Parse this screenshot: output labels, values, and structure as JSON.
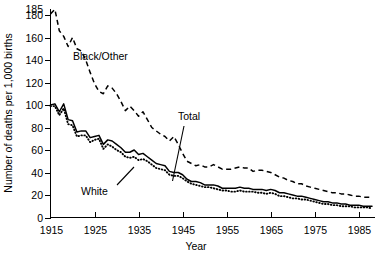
{
  "chart_data": {
    "type": "line",
    "title": "",
    "xlabel": "Year",
    "ylabel": "Number of deaths per 1,000 births",
    "xlim": [
      1915,
      1988
    ],
    "ylim": [
      0,
      185
    ],
    "grid": false,
    "legend_position": "inline-annotations",
    "xticks": [
      1915,
      1925,
      1935,
      1945,
      1955,
      1965,
      1975,
      1985
    ],
    "xtick_labels": [
      "1915",
      "1925",
      "1935",
      "1945",
      "1955",
      "1965",
      "1975",
      "1985"
    ],
    "yticks": [
      0,
      20,
      40,
      60,
      80,
      100,
      120,
      140,
      160,
      180,
      185
    ],
    "ytick_labels": [
      "0",
      "20",
      "40",
      "60",
      "80",
      "100",
      "120",
      "140",
      "160",
      "180",
      "185"
    ],
    "annotations": [
      {
        "text": "Black/Other",
        "series": "Black/Other"
      },
      {
        "text": "Total",
        "series": "Total"
      },
      {
        "text": "White",
        "series": "White"
      }
    ],
    "x": [
      1915,
      1916,
      1917,
      1918,
      1919,
      1920,
      1921,
      1922,
      1923,
      1924,
      1925,
      1926,
      1927,
      1928,
      1929,
      1930,
      1931,
      1932,
      1933,
      1934,
      1935,
      1936,
      1937,
      1938,
      1939,
      1940,
      1941,
      1942,
      1943,
      1944,
      1945,
      1946,
      1947,
      1948,
      1949,
      1950,
      1951,
      1952,
      1953,
      1954,
      1955,
      1956,
      1957,
      1958,
      1959,
      1960,
      1961,
      1962,
      1963,
      1964,
      1965,
      1966,
      1967,
      1968,
      1969,
      1970,
      1971,
      1972,
      1973,
      1974,
      1975,
      1976,
      1977,
      1978,
      1979,
      1980,
      1981,
      1982,
      1983,
      1984,
      1985,
      1986,
      1987,
      1988
    ],
    "series": [
      {
        "name": "Black/Other",
        "style": "dashed",
        "values": [
          181,
          185,
          166,
          161,
          152,
          160,
          150,
          148,
          140,
          129,
          119,
          112,
          110,
          117,
          115,
          110,
          103,
          95,
          99,
          95,
          90,
          94,
          87,
          80,
          77,
          74,
          72,
          68,
          72,
          65,
          57,
          50,
          48,
          46,
          47,
          45,
          45,
          47,
          45,
          43,
          43,
          43,
          44,
          45,
          44,
          44,
          41,
          42,
          42,
          41,
          40,
          38,
          36,
          35,
          33,
          32,
          30,
          30,
          28,
          27,
          26,
          25,
          24,
          23,
          22,
          22,
          21,
          21,
          20,
          19,
          19,
          18,
          18,
          18
        ]
      },
      {
        "name": "Total",
        "style": "solid",
        "values": [
          100,
          101,
          94,
          101,
          87,
          86,
          76,
          77,
          77,
          71,
          72,
          73,
          65,
          69,
          68,
          65,
          62,
          58,
          58,
          60,
          56,
          57,
          54,
          51,
          48,
          47,
          46,
          41,
          40,
          40,
          38,
          34,
          32,
          32,
          31,
          29,
          29,
          29,
          28,
          26,
          26,
          26,
          26,
          27,
          26,
          26,
          25,
          25,
          25,
          24,
          25,
          24,
          22,
          22,
          21,
          20,
          19,
          19,
          18,
          17,
          16,
          15,
          14,
          14,
          13,
          13,
          12,
          12,
          11,
          11,
          11,
          10,
          10,
          10
        ]
      },
      {
        "name": "White",
        "style": "dotted",
        "values": [
          99,
          99,
          91,
          97,
          83,
          82,
          72,
          73,
          73,
          67,
          69,
          70,
          61,
          65,
          63,
          60,
          58,
          54,
          53,
          54,
          51,
          52,
          50,
          47,
          44,
          43,
          42,
          38,
          37,
          37,
          35,
          32,
          30,
          29,
          28,
          27,
          27,
          26,
          25,
          24,
          24,
          23,
          23,
          24,
          23,
          23,
          23,
          22,
          22,
          21,
          22,
          21,
          19,
          19,
          18,
          17,
          17,
          16,
          16,
          15,
          14,
          13,
          12,
          12,
          11,
          11,
          10,
          10,
          10,
          9,
          9,
          9,
          9,
          8
        ]
      }
    ]
  },
  "labels": {
    "black_other": "Black/Other",
    "total": "Total",
    "white": "White",
    "xaxis": "Year",
    "yaxis": "Number of deaths per 1,000 births"
  }
}
